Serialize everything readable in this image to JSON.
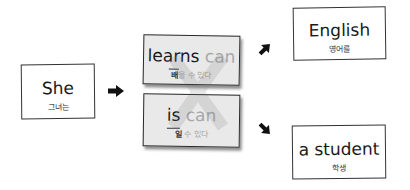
{
  "subject": {
    "en": "She",
    "ko": "그녀는"
  },
  "verbs": [
    {
      "en_main": "learns",
      "en_ghost": "can",
      "ko_main": "배",
      "ko_ghost": "울 수 있다"
    },
    {
      "en_main": "is",
      "en_ghost": "can",
      "ko_main": "일",
      "ko_ghost": "수 있다"
    }
  ],
  "objects": [
    {
      "en": "English",
      "ko": "영어를"
    },
    {
      "en": "a student",
      "ko": "학생"
    }
  ],
  "icons": [
    "arrow-right-icon",
    "arrow-up-right-icon",
    "arrow-down-right-icon",
    "x-mark-icon"
  ],
  "colors": {
    "border": "#333333",
    "card_fill": "#e9e9e9",
    "ghost_text": "#a8a8a8"
  }
}
